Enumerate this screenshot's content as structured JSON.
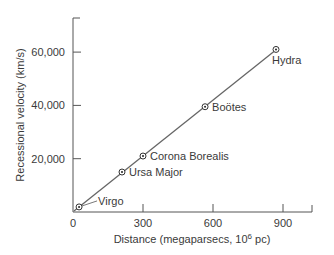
{
  "chart_data": {
    "type": "scatter",
    "title": "",
    "xlabel": "Distance (megaparsecs, 10",
    "xlabel_sup": "6",
    "xlabel_tail": " pc)",
    "ylabel": "Recessional velocity (km/s)",
    "xlim": [
      0,
      1000
    ],
    "ylim": [
      0,
      70000
    ],
    "grid": false,
    "x_ticks": [
      0,
      300,
      600,
      900
    ],
    "x_tick_labels": [
      "0",
      "300",
      "600",
      "900"
    ],
    "y_ticks": [
      20000,
      40000,
      60000
    ],
    "y_tick_labels": [
      "20,000",
      "40,000",
      "60,000"
    ],
    "fit_line": {
      "x": [
        0,
        880
      ],
      "y": [
        0,
        61500
      ]
    },
    "points": [
      {
        "name": "Virgo",
        "x": 26,
        "y": 1900
      },
      {
        "name": "Ursa Major",
        "x": 210,
        "y": 15000
      },
      {
        "name": "Corona Borealis",
        "x": 300,
        "y": 21000
      },
      {
        "name": "Boötes",
        "x": 566,
        "y": 39500
      },
      {
        "name": "Hydra",
        "x": 870,
        "y": 61000
      }
    ]
  }
}
